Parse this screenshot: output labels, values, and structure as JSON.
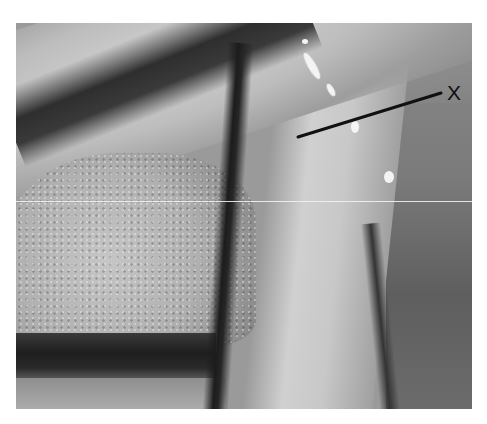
{
  "figure": {
    "type": "grayscale anatomical photograph",
    "annotation": {
      "label": "X",
      "leader_line": {
        "x1": 298,
        "y1": 137,
        "x2": 441,
        "y2": 93
      },
      "label_color": "#111111"
    },
    "colors": {
      "background": "#ffffff",
      "dark_shadow": "#1e1e1e",
      "mid_tissue": "#9a9a9a",
      "pale_tissue": "#d0d0d0",
      "highlight": "#f4f4f4"
    }
  }
}
